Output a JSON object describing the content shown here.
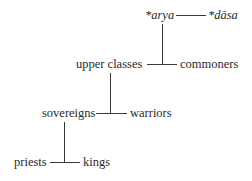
{
  "diagram": {
    "type": "hierarchy",
    "nodes": {
      "arya": "*arya",
      "dasa": "*dāsa",
      "upper_classes": "upper classes",
      "commoners": "commoners",
      "sovereigns": "sovereigns",
      "warriors": "warriors",
      "priests": "priests",
      "kings": "kings"
    },
    "edges": [
      [
        "*arya",
        "*dāsa"
      ],
      [
        "*arya",
        "upper classes / commoners"
      ],
      [
        "upper classes",
        "commoners"
      ],
      [
        "upper classes",
        "sovereigns / warriors"
      ],
      [
        "sovereigns",
        "warriors"
      ],
      [
        "sovereigns",
        "priests / kings"
      ],
      [
        "priests",
        "kings"
      ]
    ]
  }
}
